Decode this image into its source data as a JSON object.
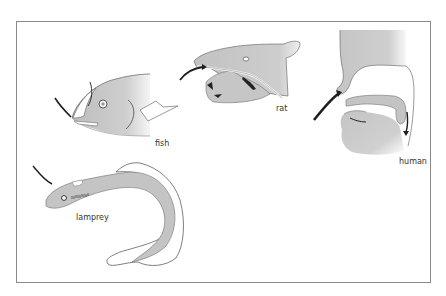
{
  "figure": {
    "panels": [
      {
        "id": "fish",
        "label": "fish"
      },
      {
        "id": "rat",
        "label": "rat"
      },
      {
        "id": "human",
        "label": "human"
      },
      {
        "id": "lamprey",
        "label": "lamprey"
      }
    ]
  },
  "colors": {
    "body_fill": "#c4c4c4",
    "outline": "#6e6e6e",
    "arrow": "#1e1e1e",
    "frame": "#8a8a8a"
  }
}
